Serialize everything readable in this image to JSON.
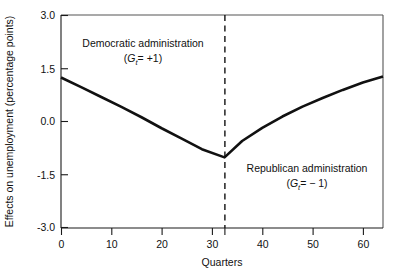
{
  "chart_data": {
    "type": "line",
    "title": "",
    "xlabel": "Quarters",
    "ylabel": "Effects on unemployment (percentage points)",
    "xlim": [
      0,
      64
    ],
    "ylim": [
      -3.0,
      3.0
    ],
    "grid": false,
    "legend": "none",
    "x_ticks": [
      0,
      10,
      20,
      30,
      40,
      50,
      60
    ],
    "x_tick_labels": [
      "0",
      "10",
      "20",
      "30",
      "40",
      "50",
      "60"
    ],
    "x_extra_unlabeled_ticks": [
      32.5
    ],
    "y_ticks": [
      3.0,
      1.5,
      0.0,
      -1.5,
      -3.0
    ],
    "y_tick_labels": [
      "3.0",
      "1.5",
      "0.0",
      "-1.5",
      "-3.0"
    ],
    "series": [
      {
        "name": "Effects on unemployment",
        "x": [
          0,
          4,
          8,
          12,
          16,
          20,
          24,
          28,
          32.5,
          36,
          40,
          44,
          48,
          52,
          56,
          60,
          64
        ],
        "values": [
          1.24,
          0.97,
          0.69,
          0.41,
          0.12,
          -0.19,
          -0.48,
          -0.78,
          -1.01,
          -0.55,
          -0.18,
          0.14,
          0.42,
          0.66,
          0.89,
          1.1,
          1.27
        ]
      }
    ],
    "vertical_divider": {
      "x": 32.5,
      "style": "dashed",
      "label": ""
    },
    "annotations": [
      {
        "id": "democratic",
        "line1": "Democratic administration",
        "symbol": "G",
        "subscript": "t",
        "relation": "=",
        "value": "+1",
        "x": 16,
        "y": 2.35
      },
      {
        "id": "republican",
        "line1": "Republican administration",
        "symbol": "G",
        "subscript": "t",
        "relation": "=",
        "value": "− 1",
        "x": 48,
        "y": -1.45
      }
    ]
  },
  "colors": {
    "series": "#111111",
    "axis": "#1a1a1a",
    "frame": "#555555",
    "background": "#ffffff",
    "text": "#111111"
  }
}
